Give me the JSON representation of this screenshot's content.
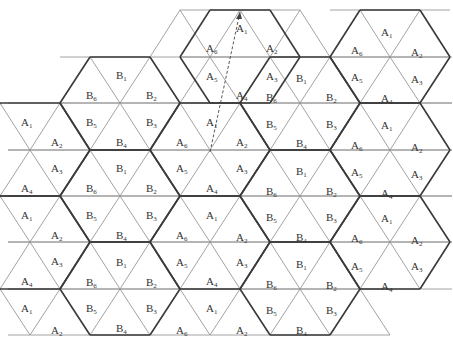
{
  "diagram": {
    "colors": {
      "thin_line": "#8a8a8a",
      "thick_line": "#3a3a3a",
      "text": "#333333"
    },
    "grid": {
      "row_y": [
        10,
        57,
        103,
        150,
        196,
        242,
        289,
        335
      ],
      "half_side": 30
    },
    "labels": [
      {
        "t": "A",
        "s": "1",
        "x": 240,
        "y": 28
      },
      {
        "t": "A",
        "s": "6",
        "x": 210,
        "y": 48
      },
      {
        "t": "A",
        "s": "2",
        "x": 270,
        "y": 48
      },
      {
        "t": "A",
        "s": "5",
        "x": 210,
        "y": 76
      },
      {
        "t": "A",
        "s": "3",
        "x": 270,
        "y": 76
      },
      {
        "t": "A",
        "s": "4",
        "x": 240,
        "y": 95
      },
      {
        "t": "A",
        "s": "1",
        "x": 385,
        "y": 32
      },
      {
        "t": "A",
        "s": "6",
        "x": 355,
        "y": 50
      },
      {
        "t": "A",
        "s": "2",
        "x": 415,
        "y": 52
      },
      {
        "t": "A",
        "s": "5",
        "x": 355,
        "y": 77
      },
      {
        "t": "A",
        "s": "3",
        "x": 415,
        "y": 79
      },
      {
        "t": "A",
        "s": "4",
        "x": 385,
        "y": 98
      },
      {
        "t": "B",
        "s": "1",
        "x": 120,
        "y": 75
      },
      {
        "t": "B",
        "s": "6",
        "x": 90,
        "y": 95
      },
      {
        "t": "B",
        "s": "2",
        "x": 150,
        "y": 95
      },
      {
        "t": "B",
        "s": "5",
        "x": 90,
        "y": 122
      },
      {
        "t": "B",
        "s": "3",
        "x": 150,
        "y": 122
      },
      {
        "t": "B",
        "s": "4",
        "x": 120,
        "y": 142
      },
      {
        "t": "A",
        "s": "1",
        "x": 210,
        "y": 122
      },
      {
        "t": "A",
        "s": "6",
        "x": 180,
        "y": 142
      },
      {
        "t": "A",
        "s": "2",
        "x": 240,
        "y": 142
      },
      {
        "t": "A",
        "s": "5",
        "x": 180,
        "y": 168
      },
      {
        "t": "A",
        "s": "3",
        "x": 240,
        "y": 168
      },
      {
        "t": "A",
        "s": "4",
        "x": 210,
        "y": 188
      },
      {
        "t": "B",
        "s": "1",
        "x": 300,
        "y": 78
      },
      {
        "t": "B",
        "s": "6",
        "x": 270,
        "y": 97
      },
      {
        "t": "B",
        "s": "2",
        "x": 330,
        "y": 97
      },
      {
        "t": "B",
        "s": "5",
        "x": 270,
        "y": 124
      },
      {
        "t": "B",
        "s": "3",
        "x": 330,
        "y": 124
      },
      {
        "t": "B",
        "s": "4",
        "x": 300,
        "y": 143
      },
      {
        "t": "A",
        "s": "1",
        "x": 385,
        "y": 125
      },
      {
        "t": "A",
        "s": "6",
        "x": 355,
        "y": 145
      },
      {
        "t": "A",
        "s": "2",
        "x": 415,
        "y": 147
      },
      {
        "t": "A",
        "s": "5",
        "x": 355,
        "y": 172
      },
      {
        "t": "A",
        "s": "3",
        "x": 415,
        "y": 174
      },
      {
        "t": "A",
        "s": "4",
        "x": 385,
        "y": 193
      },
      {
        "t": "A",
        "s": "1",
        "x": 25,
        "y": 122
      },
      {
        "t": "A",
        "s": "2",
        "x": 55,
        "y": 142
      },
      {
        "t": "A",
        "s": "3",
        "x": 55,
        "y": 168
      },
      {
        "t": "A",
        "s": "4",
        "x": 25,
        "y": 188
      },
      {
        "t": "B",
        "s": "1",
        "x": 120,
        "y": 168
      },
      {
        "t": "B",
        "s": "6",
        "x": 90,
        "y": 188
      },
      {
        "t": "B",
        "s": "2",
        "x": 150,
        "y": 188
      },
      {
        "t": "B",
        "s": "5",
        "x": 90,
        "y": 215
      },
      {
        "t": "B",
        "s": "3",
        "x": 150,
        "y": 215
      },
      {
        "t": "B",
        "s": "4",
        "x": 120,
        "y": 235
      },
      {
        "t": "B",
        "s": "1",
        "x": 300,
        "y": 171
      },
      {
        "t": "B",
        "s": "6",
        "x": 270,
        "y": 191
      },
      {
        "t": "B",
        "s": "2",
        "x": 330,
        "y": 191
      },
      {
        "t": "B",
        "s": "5",
        "x": 270,
        "y": 217
      },
      {
        "t": "B",
        "s": "3",
        "x": 330,
        "y": 217
      },
      {
        "t": "B",
        "s": "4",
        "x": 300,
        "y": 237
      },
      {
        "t": "A",
        "s": "1",
        "x": 210,
        "y": 215
      },
      {
        "t": "A",
        "s": "6",
        "x": 180,
        "y": 235
      },
      {
        "t": "A",
        "s": "2",
        "x": 240,
        "y": 237
      },
      {
        "t": "A",
        "s": "5",
        "x": 180,
        "y": 262
      },
      {
        "t": "A",
        "s": "3",
        "x": 240,
        "y": 262
      },
      {
        "t": "A",
        "s": "4",
        "x": 210,
        "y": 281
      },
      {
        "t": "A",
        "s": "1",
        "x": 385,
        "y": 218
      },
      {
        "t": "A",
        "s": "6",
        "x": 355,
        "y": 238
      },
      {
        "t": "A",
        "s": "2",
        "x": 415,
        "y": 240
      },
      {
        "t": "A",
        "s": "5",
        "x": 355,
        "y": 266
      },
      {
        "t": "A",
        "s": "3",
        "x": 415,
        "y": 266
      },
      {
        "t": "A",
        "s": "4",
        "x": 385,
        "y": 286
      },
      {
        "t": "A",
        "s": "1",
        "x": 25,
        "y": 215
      },
      {
        "t": "A",
        "s": "2",
        "x": 55,
        "y": 235
      },
      {
        "t": "A",
        "s": "3",
        "x": 55,
        "y": 261
      },
      {
        "t": "A",
        "s": "4",
        "x": 25,
        "y": 281
      },
      {
        "t": "B",
        "s": "1",
        "x": 120,
        "y": 262
      },
      {
        "t": "B",
        "s": "6",
        "x": 90,
        "y": 282
      },
      {
        "t": "B",
        "s": "2",
        "x": 150,
        "y": 282
      },
      {
        "t": "B",
        "s": "5",
        "x": 90,
        "y": 308
      },
      {
        "t": "B",
        "s": "3",
        "x": 150,
        "y": 308
      },
      {
        "t": "B",
        "s": "4",
        "x": 120,
        "y": 328
      },
      {
        "t": "B",
        "s": "1",
        "x": 300,
        "y": 264
      },
      {
        "t": "B",
        "s": "6",
        "x": 270,
        "y": 284
      },
      {
        "t": "B",
        "s": "2",
        "x": 330,
        "y": 285
      },
      {
        "t": "B",
        "s": "5",
        "x": 270,
        "y": 310
      },
      {
        "t": "B",
        "s": "3",
        "x": 330,
        "y": 310
      },
      {
        "t": "B",
        "s": "4",
        "x": 300,
        "y": 330
      },
      {
        "t": "A",
        "s": "1",
        "x": 210,
        "y": 308
      },
      {
        "t": "A",
        "s": "6",
        "x": 180,
        "y": 330
      },
      {
        "t": "A",
        "s": "2",
        "x": 240,
        "y": 330
      },
      {
        "t": "A",
        "s": "1",
        "x": 25,
        "y": 308
      },
      {
        "t": "A",
        "s": "2",
        "x": 55,
        "y": 330
      }
    ],
    "dashed_arrow": {
      "x1": 210,
      "y1": 152,
      "x2": 240,
      "y2": 12
    }
  }
}
